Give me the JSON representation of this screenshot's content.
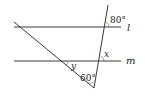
{
  "diagram": {
    "lines": {
      "l": {
        "label": "l",
        "y": 27,
        "x1": 14,
        "x2": 121
      },
      "m": {
        "label": "m",
        "y": 61,
        "x1": 14,
        "x2": 121
      },
      "transversal": {
        "x1": 108,
        "y1": 5,
        "x2": 94,
        "y2": 88
      },
      "diagonal": {
        "x1": 14,
        "y1": 22,
        "x2": 94,
        "y2": 88
      }
    },
    "angles": {
      "top": {
        "label": "80°",
        "x": 110,
        "y": 23
      },
      "x": {
        "label": "x",
        "x": 104,
        "y": 57
      },
      "y": {
        "label": "y",
        "x": 71,
        "y": 69
      },
      "bottom": {
        "label": "60°",
        "x": 80,
        "y": 81
      }
    },
    "line_labels": {
      "l": {
        "label": "l",
        "x": 127,
        "y": 31
      },
      "m": {
        "label": "m",
        "x": 126,
        "y": 64
      }
    }
  }
}
